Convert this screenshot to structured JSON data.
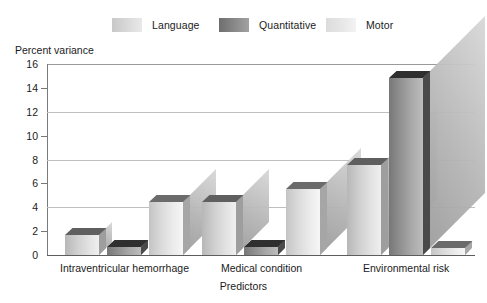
{
  "chart_data": {
    "type": "bar",
    "title": "",
    "subtitle": "",
    "xlabel": "Predictors",
    "ylabel": "Percent variance",
    "categories": [
      "Intraventricular hemorrhage",
      "Medical condition",
      "Environmental risk"
    ],
    "series": [
      {
        "name": "Language",
        "values": [
          1.7,
          4.4,
          7.5
        ],
        "color": "#d7d7d7"
      },
      {
        "name": "Quantitative",
        "values": [
          0.7,
          0.7,
          14.8
        ],
        "color": "#858585"
      },
      {
        "name": "Motor",
        "values": [
          4.4,
          5.5,
          0.6
        ],
        "color": "#e6e6e6"
      }
    ],
    "ylim": [
      0,
      16
    ],
    "yticks": [
      0,
      2,
      4,
      6,
      8,
      10,
      12,
      14,
      16
    ],
    "ytick_labels": [
      "0",
      "2",
      "4",
      "6",
      "8",
      "10",
      "12",
      "14",
      "16"
    ],
    "major_gridlines": [
      4,
      8,
      12,
      16
    ],
    "minor_ticks": [
      2,
      6,
      10,
      14
    ],
    "grid": true,
    "legend_position": "top",
    "style": "3d-bar"
  },
  "legend": {
    "items": [
      {
        "label": "Language",
        "swatch": "language-swatch"
      },
      {
        "label": "Quantitative",
        "swatch": "quantitative-swatch"
      },
      {
        "label": "Motor",
        "swatch": "motor-swatch"
      }
    ]
  },
  "axes": {
    "y_title": "Percent variance",
    "x_title": "Predictors",
    "y_labels": [
      "16",
      "14",
      "12",
      "10",
      "8",
      "6",
      "4",
      "2",
      "0"
    ],
    "x_labels": [
      "Intraventricular hemorrhage",
      "Medical condition",
      "Environmental risk"
    ]
  }
}
